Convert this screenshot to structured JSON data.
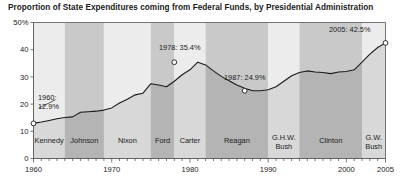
{
  "chart_data": {
    "type": "area",
    "title": "Proportion of State Expenditures coming from Federal Funds, by Presidential Administration",
    "xlabel": "",
    "ylabel": "",
    "xlim": [
      1960,
      2005
    ],
    "ylim": [
      0,
      50
    ],
    "grid": false,
    "legend": "none",
    "ytick_labels": [
      "0",
      "10",
      "20",
      "30",
      "40",
      "50%"
    ],
    "ytick_values": [
      0,
      10,
      20,
      30,
      40,
      50
    ],
    "xtick_labels": [
      "1960",
      "1970",
      "1980",
      "1990",
      "2000",
      "2005"
    ],
    "xtick_values": [
      1960,
      1970,
      1980,
      1990,
      2000,
      2005
    ],
    "x": [
      1960,
      1961,
      1962,
      1963,
      1964,
      1965,
      1966,
      1967,
      1968,
      1969,
      1970,
      1971,
      1972,
      1973,
      1974,
      1975,
      1976,
      1977,
      1978,
      1979,
      1980,
      1981,
      1982,
      1983,
      1984,
      1985,
      1986,
      1987,
      1988,
      1989,
      1990,
      1991,
      1992,
      1993,
      1994,
      1995,
      1996,
      1997,
      1998,
      1999,
      2000,
      2001,
      2002,
      2003,
      2004,
      2005
    ],
    "values": [
      12.9,
      13.4,
      14.0,
      14.6,
      15.1,
      15.3,
      17.0,
      17.2,
      17.4,
      17.8,
      18.6,
      20.4,
      21.8,
      23.4,
      24.0,
      27.5,
      27.0,
      26.4,
      28.4,
      30.8,
      32.6,
      35.4,
      34.4,
      32.2,
      30.2,
      28.6,
      27.0,
      25.8,
      24.9,
      24.9,
      25.3,
      26.4,
      28.4,
      30.4,
      31.6,
      32.2,
      31.8,
      31.6,
      31.2,
      31.8,
      32.0,
      32.6,
      35.4,
      38.4,
      40.8,
      42.5
    ],
    "annotations": [
      {
        "id": "annot-1960",
        "label": "1960:",
        "label2": "12.9%",
        "year": 1960,
        "value": 12.9
      },
      {
        "id": "annot-1978",
        "label": "1978: 35.4%",
        "year": 1978,
        "value": 35.4
      },
      {
        "id": "annot-1987",
        "label": "1987: 24.9%",
        "year": 1987,
        "value": 24.9
      },
      {
        "id": "annot-2005",
        "label": "2005: 42.5%",
        "year": 2005,
        "value": 42.5
      }
    ],
    "administration_bands": [
      {
        "label": "Kennedy",
        "start": 1960,
        "end": 1964,
        "shade": "light"
      },
      {
        "label": "Johnson",
        "start": 1964,
        "end": 1969,
        "shade": "dark"
      },
      {
        "label": "Nixon",
        "start": 1969,
        "end": 1975,
        "shade": "light"
      },
      {
        "label": "Ford",
        "start": 1975,
        "end": 1978,
        "shade": "dark"
      },
      {
        "label": "Carter",
        "start": 1978,
        "end": 1982,
        "shade": "light"
      },
      {
        "label": "Reagan",
        "start": 1982,
        "end": 1990,
        "shade": "dark"
      },
      {
        "label": "G.H.W.",
        "label2": "Bush",
        "start": 1990,
        "end": 1994,
        "shade": "light"
      },
      {
        "label": "Clinton",
        "start": 1994,
        "end": 2002,
        "shade": "dark"
      },
      {
        "label": "G.W.",
        "label2": "Bush",
        "start": 2002,
        "end": 2005,
        "shade": "light"
      }
    ],
    "colors": {
      "band_light": "#ececec",
      "band_dark": "#c9c9c9",
      "area_light": "#d8d8d8",
      "area_dark": "#b4b4b4",
      "line": "#1a1a1a",
      "axis": "#555555",
      "text": "#1a1a1a",
      "marker_fill": "#ffffff"
    }
  }
}
